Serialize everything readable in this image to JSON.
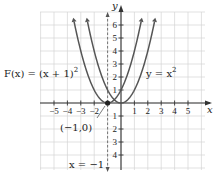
{
  "chart_data": {
    "type": "line",
    "title": "",
    "xlabel": "x",
    "ylabel": "y",
    "xlim": [
      -5,
      5
    ],
    "ylim": [
      -4,
      6
    ],
    "grid": true,
    "x_ticks": [
      "−5",
      "−4",
      "−3",
      "−2",
      "1",
      "2",
      "3",
      "4",
      "5"
    ],
    "y_ticks": [
      "6",
      "5",
      "4",
      "3",
      "2",
      "1",
      "1",
      "2",
      "3",
      "4"
    ],
    "series": [
      {
        "name": "F(x) = (x + 1)^2",
        "equation": "(x+1)^2",
        "x": [
          -3.6,
          -3,
          -2,
          -1,
          0,
          1,
          1.6
        ],
        "y": [
          6.76,
          4,
          1,
          0,
          1,
          4,
          6.76
        ]
      },
      {
        "name": "y = x^2",
        "equation": "x^2",
        "x": [
          -2.6,
          -2,
          -1,
          0,
          1,
          2,
          2.6
        ],
        "y": [
          6.76,
          4,
          1,
          0,
          1,
          4,
          6.76
        ]
      }
    ],
    "annotations": [
      {
        "text": "(−1,0)",
        "point": [
          -1,
          0
        ]
      },
      {
        "text": "x = −1",
        "type": "dashed vertical line",
        "x": -1
      }
    ]
  },
  "labels": {
    "x_axis": "x",
    "y_axis": "y",
    "f_label_prefix": "F(x) = (x + 1)",
    "f_label_exp": "2",
    "g_label_prefix": "y = x",
    "g_label_exp": "2",
    "vertex": "(−1,0)",
    "asymptote": "x = −1"
  }
}
